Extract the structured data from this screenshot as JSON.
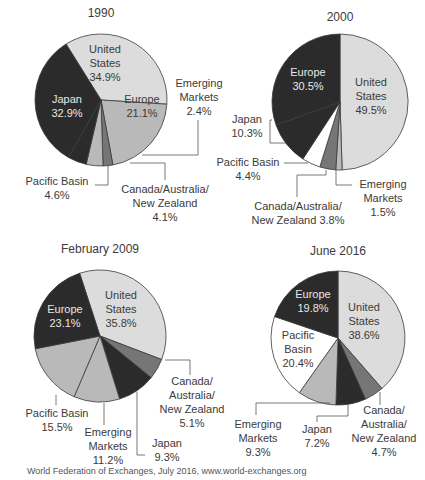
{
  "colors": {
    "dark": "#2b2b2b",
    "light_gray": "#dcdcdc",
    "mid_gray": "#b9b9b9",
    "dark_gray": "#767676",
    "white": "#ffffff",
    "stroke": "#3a3a3a"
  },
  "caption": "World Federation of Exchanges, July 2016, www.world-exchanges.org",
  "chart_data": [
    {
      "type": "pie",
      "title": "1990",
      "categories": [
        "United States",
        "Europe",
        "Emerging Markets",
        "Canada/Australia/New Zealand",
        "Pacific Basin",
        "Japan"
      ],
      "values": [
        34.9,
        21.1,
        2.4,
        4.1,
        4.6,
        32.9
      ],
      "unit": "%"
    },
    {
      "type": "pie",
      "title": "2000",
      "categories": [
        "United States",
        "Emerging Markets",
        "Canada/Australia/New Zealand",
        "Pacific Basin",
        "Japan",
        "Europe"
      ],
      "values": [
        49.5,
        1.5,
        3.8,
        4.4,
        10.3,
        30.5
      ],
      "unit": "%"
    },
    {
      "type": "pie",
      "title": "February 2009",
      "categories": [
        "United States",
        "Canada/Australia/New Zealand",
        "Japan",
        "Emerging Markets",
        "Pacific Basin",
        "Europe"
      ],
      "values": [
        35.8,
        5.1,
        9.3,
        11.2,
        15.5,
        23.1
      ],
      "unit": "%"
    },
    {
      "type": "pie",
      "title": "June 2016",
      "categories": [
        "United States",
        "Canada/Australia/New Zealand",
        "Japan",
        "Emerging Markets",
        "Pacific Basin",
        "Europe"
      ],
      "values": [
        38.6,
        4.7,
        7.2,
        9.3,
        20.4,
        19.8
      ],
      "unit": "%"
    }
  ],
  "pies": [
    {
      "title": "1990",
      "tx": 101,
      "ty": 17,
      "cx": 101,
      "cy": 100,
      "r": 66,
      "start": -122,
      "slices": [
        {
          "name": "United States",
          "value": 34.9,
          "fill": "light_gray"
        },
        {
          "name": "Europe",
          "value": 21.1,
          "fill": "mid_gray"
        },
        {
          "name": "Emerging Markets",
          "value": 2.4,
          "fill": "dark_gray"
        },
        {
          "name": "Canada/Australia/New Zealand",
          "value": 4.1,
          "fill": "mid_gray"
        },
        {
          "name": "Pacific Basin",
          "value": 4.6,
          "fill": "dark"
        },
        {
          "name": "Japan",
          "value": 32.9,
          "fill": "dark"
        }
      ],
      "labels": [
        {
          "lines": [
            "United",
            "States",
            "34.9%"
          ],
          "x": 105,
          "y": 53,
          "cls": "in-light"
        },
        {
          "lines": [
            "Europe",
            "21.1%"
          ],
          "x": 142,
          "y": 103,
          "cls": "in-light"
        },
        {
          "lines": [
            "Japan",
            "32.9%"
          ],
          "x": 67,
          "y": 103,
          "cls": "in-dark"
        },
        {
          "lines": [
            "Emerging",
            "Markets",
            "2.4%"
          ],
          "x": 199,
          "y": 87,
          "cls": "in-light"
        },
        {
          "lines": [
            "Pacific Basin",
            "4.6%"
          ],
          "x": 57,
          "y": 185,
          "cls": "in-light"
        },
        {
          "lines": [
            "Canada/Australia/",
            "New Zealand",
            "4.1%"
          ],
          "x": 165,
          "y": 193,
          "cls": "in-light"
        }
      ],
      "leaders": [
        "M142,155 L198,155 L198,120",
        "M130,163 L165,163 L165,180",
        "M108,166 L108,185 L95,185"
      ]
    },
    {
      "title": "2000",
      "tx": 340,
      "ty": 21,
      "cx": 340,
      "cy": 102,
      "r": 68,
      "start": -90,
      "slices": [
        {
          "name": "United States",
          "value": 49.5,
          "fill": "light_gray"
        },
        {
          "name": "Emerging Markets",
          "value": 1.5,
          "fill": "mid_gray"
        },
        {
          "name": "Canada/Australia/New Zealand",
          "value": 3.8,
          "fill": "dark_gray"
        },
        {
          "name": "Pacific Basin",
          "value": 4.4,
          "fill": "white"
        },
        {
          "name": "Japan",
          "value": 10.3,
          "fill": "dark"
        },
        {
          "name": "Europe",
          "value": 30.5,
          "fill": "dark"
        }
      ],
      "labels": [
        {
          "lines": [
            "Europe",
            "30.5%"
          ],
          "x": 308,
          "y": 76,
          "cls": "in-dark"
        },
        {
          "lines": [
            "United",
            "States",
            "49.5%"
          ],
          "x": 371,
          "y": 86,
          "cls": "in-light"
        },
        {
          "lines": [
            "Japan",
            "10.3%"
          ],
          "x": 247,
          "y": 123,
          "cls": "in-light"
        },
        {
          "lines": [
            "Pacific Basin",
            "4.4%"
          ],
          "x": 248,
          "y": 166,
          "cls": "in-light"
        },
        {
          "lines": [
            "Canada/Australia/",
            "New Zealand 3.8%"
          ],
          "x": 298,
          "y": 210,
          "cls": "in-light"
        },
        {
          "lines": [
            "Emerging",
            "Markets",
            "1.5%"
          ],
          "x": 383,
          "y": 188,
          "cls": "in-light"
        }
      ],
      "leaders": [
        "M272,120 L270,120 L270,143 L286,143",
        "M284,163 L308,163",
        "M326,170 L326,175 L297,175 L297,197",
        "M336,170 L336,185 L352,185"
      ]
    },
    {
      "title": "February 2009",
      "tx": 100,
      "ty": 253,
      "cx": 100,
      "cy": 336,
      "r": 66,
      "start": -108,
      "slices": [
        {
          "name": "United States",
          "value": 35.8,
          "fill": "light_gray"
        },
        {
          "name": "Canada/Australia/New Zealand",
          "value": 5.1,
          "fill": "dark_gray"
        },
        {
          "name": "Japan",
          "value": 9.3,
          "fill": "dark"
        },
        {
          "name": "Emerging Markets",
          "value": 11.2,
          "fill": "mid_gray"
        },
        {
          "name": "Pacific Basin",
          "value": 15.5,
          "fill": "mid_gray"
        },
        {
          "name": "Europe",
          "value": 23.1,
          "fill": "dark"
        }
      ],
      "labels": [
        {
          "lines": [
            "Europe",
            "23.1%"
          ],
          "x": 65,
          "y": 313,
          "cls": "in-dark"
        },
        {
          "lines": [
            "United",
            "States",
            "35.8%"
          ],
          "x": 121,
          "y": 299,
          "cls": "in-light"
        },
        {
          "lines": [
            "Canada/",
            "Australia/",
            "New Zealand",
            "5.1%"
          ],
          "x": 192,
          "y": 385,
          "cls": "in-light"
        },
        {
          "lines": [
            "Pacific Basin",
            "15.5%"
          ],
          "x": 57,
          "y": 417,
          "cls": "in-light"
        },
        {
          "lines": [
            "Emerging",
            "Markets",
            "11.2%"
          ],
          "x": 108,
          "y": 436,
          "cls": "in-light"
        },
        {
          "lines": [
            "Japan",
            "9.3%"
          ],
          "x": 167,
          "y": 447,
          "cls": "in-light"
        }
      ],
      "leaders": [
        "M165,360 L190,360 L190,375",
        "M56,395 L56,405",
        "M104,403 L104,425",
        "M137,392 L137,455 L145,455"
      ]
    },
    {
      "title": "June 2016",
      "tx": 338,
      "ty": 255,
      "cx": 338,
      "cy": 338,
      "r": 67,
      "start": -90,
      "slices": [
        {
          "name": "United States",
          "value": 38.6,
          "fill": "light_gray"
        },
        {
          "name": "Canada/Australia/New Zealand",
          "value": 4.7,
          "fill": "dark_gray"
        },
        {
          "name": "Japan",
          "value": 7.2,
          "fill": "dark"
        },
        {
          "name": "Emerging Markets",
          "value": 9.3,
          "fill": "mid_gray"
        },
        {
          "name": "Pacific Basin",
          "value": 20.4,
          "fill": "white"
        },
        {
          "name": "Europe",
          "value": 19.8,
          "fill": "dark"
        }
      ],
      "labels": [
        {
          "lines": [
            "Europe",
            "19.8%"
          ],
          "x": 313,
          "y": 298,
          "cls": "in-dark"
        },
        {
          "lines": [
            "United",
            "States",
            "38.6%"
          ],
          "x": 364,
          "y": 311,
          "cls": "in-light"
        },
        {
          "lines": [
            "Pacific",
            "Basin",
            "20.4%"
          ],
          "x": 298,
          "y": 339,
          "cls": "in-light"
        },
        {
          "lines": [
            "Emerging",
            "Markets",
            "9.3%"
          ],
          "x": 258,
          "y": 428,
          "cls": "in-light"
        },
        {
          "lines": [
            "Japan",
            "7.2%"
          ],
          "x": 317,
          "y": 433,
          "cls": "in-light"
        },
        {
          "lines": [
            "Canada/",
            "Australia/",
            "New Zealand",
            "4.7%"
          ],
          "x": 384,
          "y": 414,
          "cls": "in-light"
        }
      ],
      "leaders": [
        "M330,403 L256,403 L256,415",
        "M348,404 L348,416 L317,416 L317,422",
        "M380,392 L380,405"
      ]
    }
  ]
}
